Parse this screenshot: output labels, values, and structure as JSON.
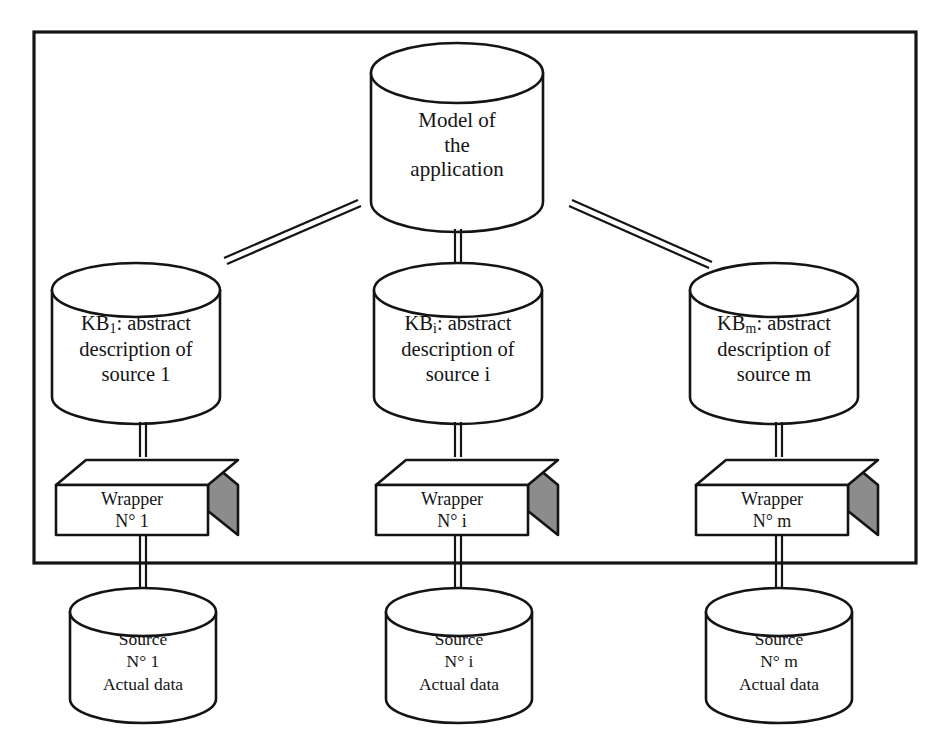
{
  "figure": {
    "frame_label": "mediation-system-boundary"
  },
  "model": {
    "line1": "Model of",
    "line2": "the",
    "line3": "application"
  },
  "knowledge_bases": [
    {
      "id": "kb-1",
      "prefix": "KB",
      "subscript": "1",
      "line1_rest": ":  abstract",
      "line2": "description  of",
      "line3": "source  1"
    },
    {
      "id": "kb-i",
      "prefix": "KB",
      "subscript": "i",
      "line1_rest": ":  abstract",
      "line2": "description  of",
      "line3": "source  i"
    },
    {
      "id": "kb-m",
      "prefix": "KB",
      "subscript": "m",
      "line1_rest": ":  abstract",
      "line2": "description  of",
      "line3": "source  m"
    }
  ],
  "wrappers": [
    {
      "id": "wrapper-1",
      "line1": "Wrapper",
      "line2": "N° 1"
    },
    {
      "id": "wrapper-i",
      "line1": "Wrapper",
      "line2": "N° i"
    },
    {
      "id": "wrapper-m",
      "line1": "Wrapper",
      "line2": "N° m"
    }
  ],
  "sources": [
    {
      "id": "source-1",
      "line1": "Source",
      "line2": "N° 1",
      "line3": "Actual data"
    },
    {
      "id": "source-i",
      "line1": "Source",
      "line2": "N° i",
      "line3": "Actual data"
    },
    {
      "id": "source-m",
      "line1": "Source",
      "line2": "N° m",
      "line3": "Actual data"
    }
  ],
  "colors": {
    "ink": "#141414",
    "paper": "#ffffff",
    "box_shade": "#8c8c8c"
  }
}
